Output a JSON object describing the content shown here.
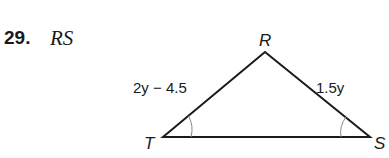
{
  "problem": {
    "number": "29.",
    "target": "RS"
  },
  "figure": {
    "type": "triangle",
    "vertices": {
      "R": {
        "label": "R"
      },
      "T": {
        "label": "T"
      },
      "S": {
        "label": "S"
      }
    },
    "sides": {
      "TR": {
        "label": "2y − 4.5"
      },
      "RS": {
        "label": "1.5y"
      }
    },
    "congruent_angles": [
      "T",
      "S"
    ],
    "stroke_color": "#1a1a1a",
    "arc_color": "#888888"
  }
}
